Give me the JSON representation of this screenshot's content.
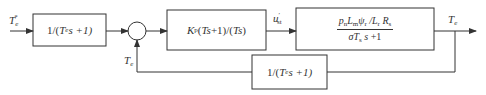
{
  "diagram": {
    "type": "control-block-diagram",
    "input": {
      "symbol": "T",
      "sub": "e",
      "sup": "*"
    },
    "blocks": [
      {
        "id": "prefilter",
        "parts": [
          "1/(",
          "T",
          "e",
          "s +1)"
        ]
      },
      {
        "id": "pi_controller",
        "parts": [
          "K",
          "p",
          "(",
          "Ts",
          " +1)/(",
          "Ts",
          ")"
        ]
      },
      {
        "id": "plant",
        "numerator": [
          "p",
          "n",
          "L",
          "m",
          "ψ",
          "r",
          " /",
          "L",
          "r",
          " R",
          "s"
        ],
        "denominator": [
          "σT",
          "s",
          " s",
          " +1"
        ]
      },
      {
        "id": "feedback_filter",
        "parts": [
          "1/(",
          "T",
          "e",
          "s +1)"
        ]
      }
    ],
    "signals": {
      "control": {
        "symbol": "u",
        "sup": "′",
        "sub": "st"
      },
      "output": {
        "symbol": "T",
        "sub": "e"
      },
      "feedback": {
        "symbol": "T",
        "sub": "e"
      }
    },
    "summing_junction": {
      "inputs": [
        "+",
        "+"
      ]
    },
    "colors": {
      "stroke": "#333333",
      "background": "#ffffff"
    }
  }
}
